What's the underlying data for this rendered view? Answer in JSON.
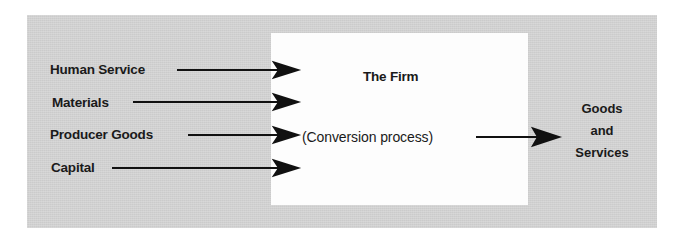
{
  "figure": {
    "kind": "block-flow-diagram",
    "panel_color": "#d3d3d3",
    "box_color": "#fdfdfd",
    "line_color": "#111111",
    "center_box": {
      "title": "The Firm",
      "subtitle": "(Conversion process)"
    },
    "inputs": [
      {
        "label": "Human Service",
        "arrow": "arrow-right-icon"
      },
      {
        "label": "Materials",
        "arrow": "arrow-right-icon"
      },
      {
        "label": "Producer Goods",
        "arrow": "arrow-right-icon"
      },
      {
        "label": "Capital",
        "arrow": "arrow-right-icon"
      }
    ],
    "output": {
      "arrow": "arrow-right-icon",
      "lines": [
        "Goods",
        "and",
        "Services"
      ]
    }
  }
}
